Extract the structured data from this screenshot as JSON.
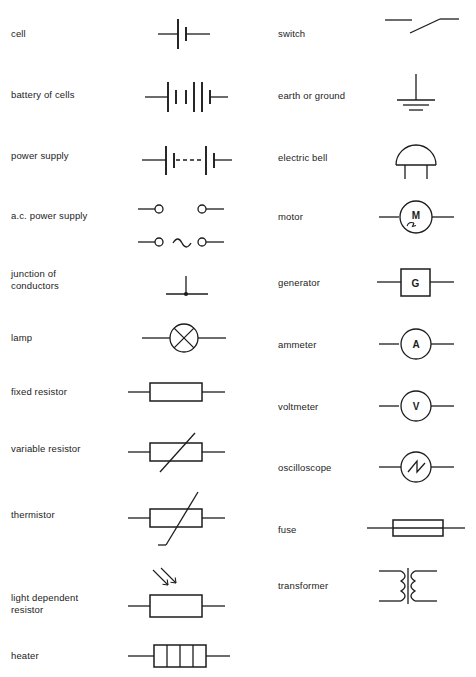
{
  "page": {
    "background_color": "#ffffff",
    "ink_color": "#1c1c1c",
    "columns": 2,
    "rows_left": 11,
    "rows_right": 10
  },
  "left_column": [
    {
      "label": "cell",
      "symbol": "cell-symbol",
      "y": 22
    },
    {
      "label": "battery of cells",
      "symbol": "battery-of-cells-symbol",
      "y": 88
    },
    {
      "label": "power supply",
      "symbol": "power-supply-symbol",
      "y": 149
    },
    {
      "label": "a.c. power supply",
      "symbol": "ac-power-supply-symbol",
      "y": 209
    },
    {
      "label": "junction of\nconductors",
      "symbol": "junction-of-conductors-symbol",
      "y": 272
    },
    {
      "label": "lamp",
      "symbol": "lamp-symbol",
      "y": 331
    },
    {
      "label": "fixed resistor",
      "symbol": "fixed-resistor-symbol",
      "y": 385
    },
    {
      "label": "variable resistor",
      "symbol": "variable-resistor-symbol",
      "y": 442
    },
    {
      "label": "thermistor",
      "symbol": "thermistor-symbol",
      "y": 508
    },
    {
      "label": "light dependent\nresistor",
      "symbol": "light-dependent-resistor-symbol",
      "y": 598
    },
    {
      "label": "heater",
      "symbol": "heater-symbol",
      "y": 649
    }
  ],
  "right_column": [
    {
      "label": "switch",
      "symbol": "switch-symbol",
      "y": 30
    },
    {
      "label": "earth or ground",
      "symbol": "earth-or-ground-symbol",
      "y": 93
    },
    {
      "label": "electric bell",
      "symbol": "electric-bell-symbol",
      "y": 155
    },
    {
      "label": "motor",
      "symbol": "motor-symbol",
      "y": 214
    },
    {
      "label": "generator",
      "symbol": "generator-symbol",
      "y": 276
    },
    {
      "label": "ammeter",
      "symbol": "ammeter-symbol",
      "y": 338
    },
    {
      "label": "voltmeter",
      "symbol": "voltmeter-symbol",
      "y": 400
    },
    {
      "label": "oscilloscope",
      "symbol": "oscilloscope-symbol",
      "y": 461
    },
    {
      "label": "fuse",
      "symbol": "fuse-symbol",
      "y": 523
    },
    {
      "label": "transformer",
      "symbol": "transformer-symbol",
      "y": 583
    }
  ],
  "symbol_glyphs": {
    "motor": "M",
    "generator": "G",
    "ammeter": "A",
    "voltmeter": "V"
  }
}
